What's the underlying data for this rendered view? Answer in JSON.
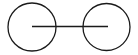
{
  "diagram": {
    "type": "two-node-graph",
    "nodes": [
      {
        "id": "node-left",
        "label": ""
      },
      {
        "id": "node-right",
        "label": ""
      }
    ],
    "edges": [
      {
        "from": "node-left",
        "to": "node-right",
        "label": ""
      }
    ],
    "stroke_color": "#1a1a1a",
    "background_color": "#ffffff"
  }
}
